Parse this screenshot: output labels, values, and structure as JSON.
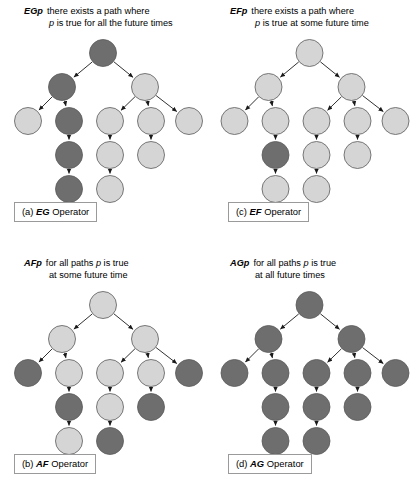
{
  "figure": {
    "colors": {
      "node_dark": "#6e6e6e",
      "node_light": "#d5d5d5",
      "node_stroke": "#5a5a5a",
      "edge": "#1a1a1a",
      "background": "#ffffff"
    },
    "tree_layout": {
      "levels": [
        [
          {
            "id": "n0",
            "x": 103,
            "y": 15
          }
        ],
        [
          {
            "id": "n1",
            "x": 62,
            "y": 49
          },
          {
            "id": "n2",
            "x": 145,
            "y": 49
          }
        ],
        [
          {
            "id": "n3",
            "x": 28,
            "y": 83
          },
          {
            "id": "n4",
            "x": 69,
            "y": 83
          },
          {
            "id": "n5",
            "x": 110,
            "y": 83
          },
          {
            "id": "n6",
            "x": 151,
            "y": 83
          },
          {
            "id": "n7",
            "x": 189,
            "y": 83
          }
        ],
        [
          {
            "id": "n8",
            "x": 69,
            "y": 117
          },
          {
            "id": "n9",
            "x": 110,
            "y": 117
          },
          {
            "id": "n10",
            "x": 151,
            "y": 117
          }
        ],
        [
          {
            "id": "n11",
            "x": 69,
            "y": 151
          },
          {
            "id": "n12",
            "x": 110,
            "y": 151
          }
        ]
      ],
      "edges": [
        [
          "n0",
          "n1"
        ],
        [
          "n0",
          "n2"
        ],
        [
          "n1",
          "n3"
        ],
        [
          "n1",
          "n4"
        ],
        [
          "n2",
          "n5"
        ],
        [
          "n2",
          "n6"
        ],
        [
          "n2",
          "n7"
        ],
        [
          "n4",
          "n8"
        ],
        [
          "n5",
          "n9"
        ],
        [
          "n6",
          "n10"
        ],
        [
          "n8",
          "n11"
        ],
        [
          "n9",
          "n12"
        ]
      ],
      "node_radius": 13.5
    }
  },
  "panels": [
    {
      "key": "a",
      "operator": "EGp",
      "caption_line1": "there exists a path where",
      "caption_line2_pre": "p",
      "caption_line2_post": " is true for all the future times",
      "label_index": "(a)",
      "label_op": "EG",
      "label_suffix": " Operator",
      "shading": {
        "n0": "dark",
        "n1": "dark",
        "n2": "light",
        "n3": "light",
        "n4": "dark",
        "n5": "light",
        "n6": "light",
        "n7": "light",
        "n8": "dark",
        "n9": "light",
        "n10": "light",
        "n11": "dark",
        "n12": "light"
      }
    },
    {
      "key": "c",
      "operator": "EFp",
      "caption_line1": "there exists a path where",
      "caption_line2_pre": "p",
      "caption_line2_post": " is true at some future time",
      "label_index": "(c)",
      "label_op": "EF",
      "label_suffix": " Operator",
      "shading": {
        "n0": "light",
        "n1": "light",
        "n2": "light",
        "n3": "light",
        "n4": "light",
        "n5": "light",
        "n6": "light",
        "n7": "light",
        "n8": "dark",
        "n9": "light",
        "n10": "light",
        "n11": "light",
        "n12": "light"
      }
    },
    {
      "key": "b",
      "operator": "AFp",
      "caption_line1_pre": "for all paths ",
      "caption_line1_p": "p",
      "caption_line1_post": " is true",
      "caption_line2": "at some future time",
      "label_index": "(b)",
      "label_op": "AF",
      "label_suffix": " Operator",
      "shading": {
        "n0": "light",
        "n1": "light",
        "n2": "light",
        "n3": "dark",
        "n4": "light",
        "n5": "light",
        "n6": "light",
        "n7": "dark",
        "n8": "dark",
        "n9": "light",
        "n10": "dark",
        "n11": "light",
        "n12": "dark"
      }
    },
    {
      "key": "d",
      "operator": "AGp",
      "caption_line1_pre": "for all paths ",
      "caption_line1_p": "p",
      "caption_line1_post": " is true",
      "caption_line2": "at all future times",
      "label_index": "(d)",
      "label_op": "AG",
      "label_suffix": " Operator",
      "shading": {
        "n0": "dark",
        "n1": "dark",
        "n2": "dark",
        "n3": "dark",
        "n4": "dark",
        "n5": "dark",
        "n6": "dark",
        "n7": "dark",
        "n8": "dark",
        "n9": "dark",
        "n10": "dark",
        "n11": "dark",
        "n12": "dark"
      }
    }
  ]
}
